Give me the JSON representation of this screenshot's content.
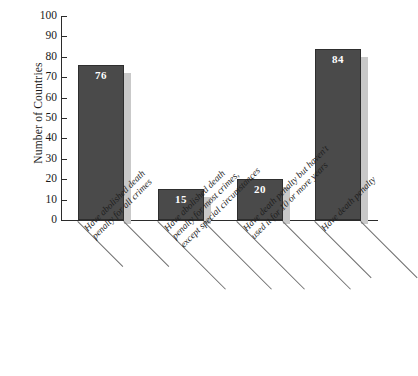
{
  "chart_data": {
    "type": "bar",
    "title": "",
    "xlabel": "",
    "ylabel": "Number of Countries",
    "ylim": [
      0,
      100
    ],
    "ytick_step": 10,
    "grid": false,
    "legend": null,
    "orientation": "vertical",
    "bar_color": "#4a4a4a",
    "shadow_color": "#c9c9c9",
    "value_label_color": "#ffffff",
    "background_color": "#ffffff",
    "categories": [
      "Have abolished death penalty for all crimes",
      "Have abolished death penalty for most crimes, except special circumstances",
      "Have death penalty but haven't used it for 10 or more years",
      "Have death penalty"
    ],
    "category_lines": [
      [
        "Have abolished death",
        "penalty for all crimes"
      ],
      [
        "Have abolished death",
        "penalty for most crimes,",
        "except special circumstances"
      ],
      [
        "Have death penalty but haven't",
        "used it for 10 or more years"
      ],
      [
        "Have death penalty"
      ]
    ],
    "values": [
      76,
      15,
      20,
      84
    ],
    "yticks": [
      "0",
      "10",
      "20",
      "30",
      "40",
      "50",
      "60",
      "70",
      "80",
      "90",
      "100"
    ]
  }
}
